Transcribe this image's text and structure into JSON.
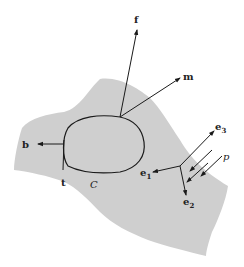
{
  "diagram": {
    "region_color": "#cfcfcf",
    "stroke_color": "#1a1a1a",
    "curve_label": "C",
    "vectors": {
      "f": "f",
      "m": "m",
      "b": "b",
      "t": "t",
      "p": "p"
    },
    "basis": {
      "e1": {
        "base": "e",
        "sub": "1"
      },
      "e2": {
        "base": "e",
        "sub": "2"
      },
      "e3": {
        "base": "e",
        "sub": "3"
      }
    }
  }
}
